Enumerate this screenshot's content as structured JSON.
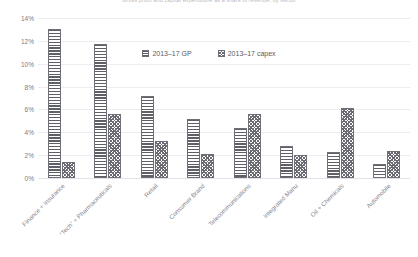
{
  "chart_data": {
    "type": "bar",
    "title": "Gross profit and capital expenditure as a share of revenue, by sector",
    "subtitle": "",
    "xlabel": "",
    "ylabel": "",
    "ylim": [
      0,
      14
    ],
    "ytick_labels": [
      "14%",
      "12%",
      "10%",
      "8%",
      "6%",
      "4%",
      "2%",
      "0%"
    ],
    "ytick_values": [
      14,
      12,
      10,
      8,
      6,
      4,
      2,
      0
    ],
    "grid": true,
    "legend_position": "top-center",
    "categories": [
      "Finance + Insurance",
      "“Tech” + Pharmaceuticals",
      "Retail",
      "Consumer Brand",
      "Telecommunications",
      "Integrated Manu",
      "Oil + Chemicals",
      "Automobile"
    ],
    "series": [
      {
        "name": "2013–17 GP",
        "pattern": "horizontal-stripes",
        "color": "#5f5f68",
        "values": [
          13.0,
          11.7,
          7.2,
          5.2,
          4.4,
          2.8,
          2.3,
          1.2
        ]
      },
      {
        "name": "2013–17 capex",
        "pattern": "crosshatch",
        "color": "#6a6a73",
        "values": [
          1.4,
          5.6,
          3.2,
          2.1,
          5.6,
          2.0,
          6.1,
          2.4
        ]
      }
    ]
  },
  "legend": {
    "items": [
      {
        "label": "2013–17 GP"
      },
      {
        "label": "2013–17 capex"
      }
    ]
  }
}
